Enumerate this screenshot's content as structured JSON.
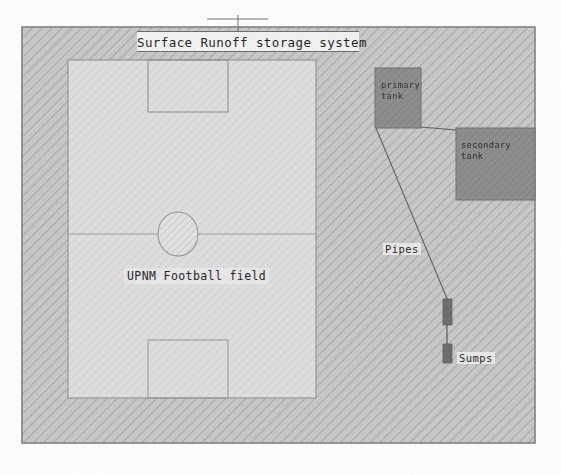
{
  "drawing": {
    "title": "Surface Runoff storage system",
    "field_label": "UPNM Football field",
    "labels": {
      "primary_tank_line1": "primary",
      "primary_tank_line2": "tank",
      "secondary_tank_line1": "secondary",
      "secondary_tank_line2": "tank",
      "pipes": "Pipes",
      "sumps": "Sumps"
    },
    "colors": {
      "paper": "#ffffff",
      "site_fill": "#c8c8c8",
      "site_hatch": "#a8a8a8",
      "field_fill": "#dcdcdc",
      "field_line": "#8d8d8d",
      "tank_fill": "#8a8a8a",
      "tank_stroke": "#6f6f6f",
      "sump_fill": "#6e6e6e",
      "pipe_line": "#5a5a5a",
      "border": "#7a7a7a",
      "text": "#1d1d1d"
    },
    "elements": [
      {
        "name": "site-boundary",
        "type": "rect",
        "x": 22,
        "y": 27,
        "w": 513,
        "h": 416
      },
      {
        "name": "football-field",
        "type": "rect",
        "x": 68,
        "y": 60,
        "w": 248,
        "h": 338
      },
      {
        "name": "halfway-line",
        "type": "line",
        "x1": 68,
        "y1": 234,
        "x2": 316,
        "y2": 234
      },
      {
        "name": "center-circle",
        "type": "circle",
        "cx": 178,
        "cy": 234,
        "r": 21
      },
      {
        "name": "penalty-box-top",
        "type": "rect",
        "x": 148,
        "y": 60,
        "w": 80,
        "h": 52
      },
      {
        "name": "penalty-box-bottom",
        "type": "rect",
        "x": 148,
        "y": 340,
        "w": 80,
        "h": 58
      },
      {
        "name": "primary-tank",
        "type": "rect",
        "x": 375,
        "y": 68,
        "w": 46,
        "h": 60
      },
      {
        "name": "secondary-tank",
        "type": "rect",
        "x": 456,
        "y": 128,
        "w": 79,
        "h": 72
      },
      {
        "name": "tank-connector",
        "type": "line",
        "x1": 421,
        "y1": 127,
        "x2": 456,
        "y2": 129
      },
      {
        "name": "pipe-main",
        "type": "line",
        "x1": 376,
        "y1": 128,
        "x2": 448,
        "y2": 300
      },
      {
        "name": "sump-upper",
        "type": "rect",
        "x": 443,
        "y": 299,
        "w": 9,
        "h": 26
      },
      {
        "name": "sump-lower",
        "type": "rect",
        "x": 443,
        "y": 344,
        "w": 9,
        "h": 19
      },
      {
        "name": "sump-connector",
        "type": "line",
        "x1": 447,
        "y1": 325,
        "x2": 447,
        "y2": 344
      },
      {
        "name": "title-leader-stem",
        "type": "line",
        "x1": 238,
        "y1": 16,
        "x2": 238,
        "y2": 52
      },
      {
        "name": "title-leader-bar",
        "type": "line",
        "x1": 208,
        "y1": 19,
        "x2": 268,
        "y2": 19
      }
    ]
  }
}
